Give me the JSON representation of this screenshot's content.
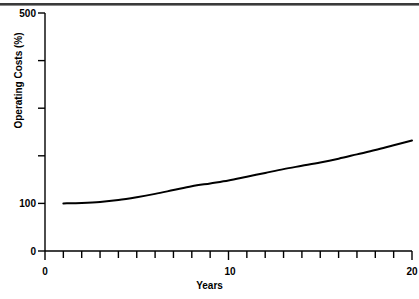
{
  "page": {
    "background_color": "#ffffff",
    "ink_color": "#000000",
    "rule_color": "#3a3a3a"
  },
  "chart_data": {
    "type": "line",
    "title": "",
    "subtitle": "",
    "xlabel": "Years",
    "ylabel": "Operating Costs (%)",
    "xlim": [
      0,
      20
    ],
    "ylim": [
      0,
      500
    ],
    "grid": false,
    "legend": false,
    "legend_position": "none",
    "x_major_ticks": [
      0,
      10,
      20
    ],
    "x_minor_ticks": [
      1,
      2,
      3,
      4,
      5,
      6,
      7,
      8,
      9,
      11,
      12,
      13,
      14,
      15,
      16,
      17,
      18,
      19
    ],
    "x_tick_labels": [
      "0",
      "10",
      "20"
    ],
    "y_ticks": [
      0,
      100,
      200,
      300,
      400,
      500
    ],
    "y_tick_labels": [
      "0",
      "100",
      "",
      "",
      "",
      "500"
    ],
    "series": [
      {
        "name": "Operating Costs",
        "color": "#000000",
        "line_width": 2,
        "x": [
          1,
          2,
          3,
          4,
          5,
          6,
          7,
          8,
          9,
          10,
          11,
          12,
          13,
          14,
          15,
          16,
          17,
          18,
          19,
          20
        ],
        "values": [
          100,
          101,
          103,
          107,
          113,
          120,
          128,
          136,
          142,
          148,
          156,
          164,
          172,
          179,
          186,
          194,
          203,
          212,
          222,
          232
        ]
      }
    ],
    "annotations": []
  },
  "axis_labels": {
    "y_500": "500",
    "y_100": "100",
    "y_0": "0",
    "x_0": "0",
    "x_10": "10",
    "x_20": "20",
    "x_title": "Years",
    "y_title": "Operating Costs (%)"
  }
}
